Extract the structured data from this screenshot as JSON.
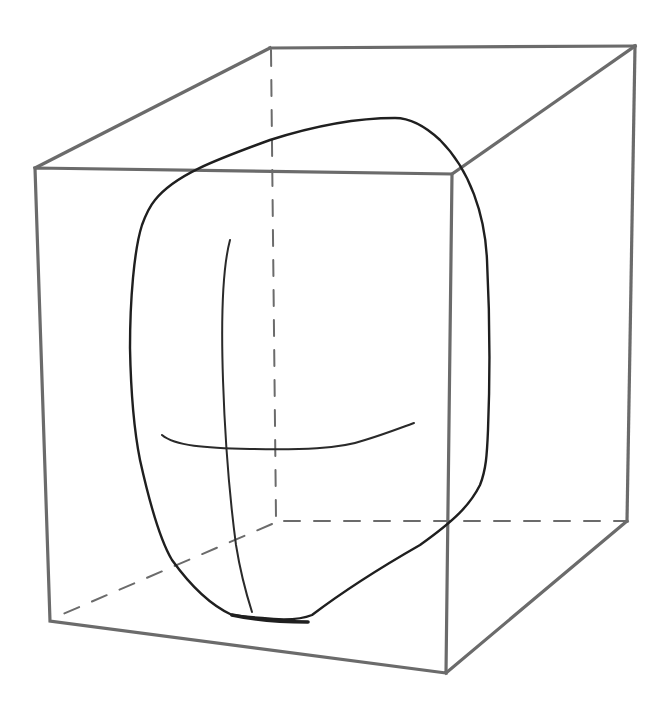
{
  "diagram": {
    "colors": {
      "background": "#ffffff",
      "box_stroke": "#6b6b6b",
      "head_stroke": "#1f1f1f"
    },
    "box": {
      "front_face": [
        [
          35,
          168
        ],
        [
          452,
          174
        ],
        [
          446,
          673
        ],
        [
          50,
          621
        ]
      ],
      "back_face": [
        [
          270,
          48
        ],
        [
          635,
          46
        ],
        [
          627,
          521
        ],
        [
          275,
          521
        ]
      ],
      "hidden_edges": [
        "back-left-vertical",
        "back-bottom",
        "bottom-left-depth"
      ]
    },
    "head": {
      "outline": "rounded cranium with angular jaw",
      "guides": [
        "vertical-center-line",
        "horizontal-brow-line"
      ]
    }
  }
}
